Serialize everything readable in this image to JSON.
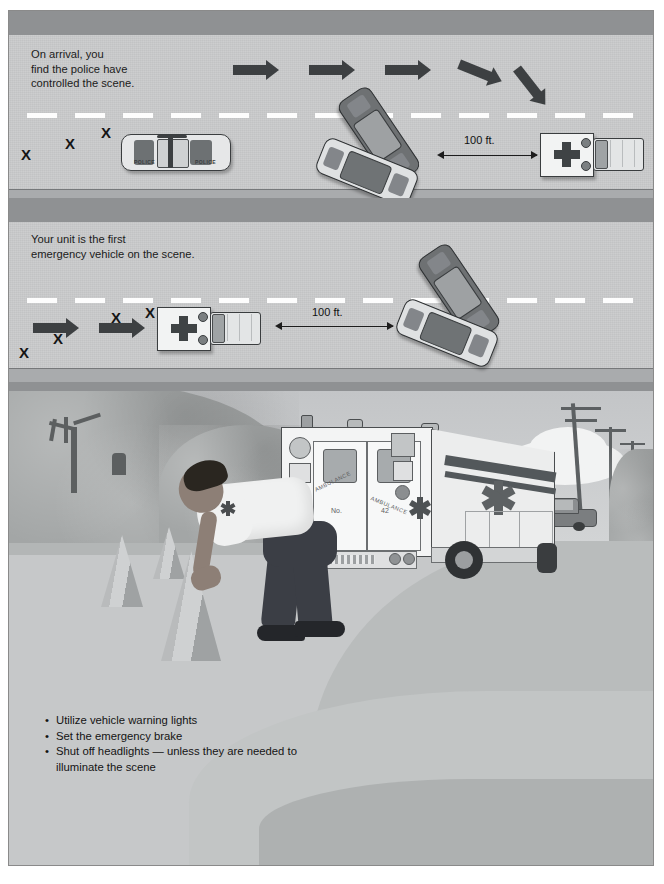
{
  "document": {
    "title": "Emergency Vehicle Scene Positioning",
    "background_color": "#ffffff",
    "frame_border_color": "#8a8a8a"
  },
  "panels": [
    {
      "id": "panel-1",
      "caption": "On arrival, you\nfind the police have\ncontrolled the scene.",
      "dimension_label": "100 ft.",
      "x_marks": [
        "X",
        "X",
        "X"
      ],
      "arrows": 5,
      "vehicles": [
        "police-car",
        "crashed-car-1",
        "crashed-car-2",
        "ambulance"
      ],
      "road_color": "#c9cacb",
      "lane_dash_color": "#fdfdfd"
    },
    {
      "id": "panel-2",
      "caption": "Your unit is the first\nemergency vehicle on the scene.",
      "dimension_label": "100 ft.",
      "x_marks": [
        "X",
        "X",
        "X"
      ],
      "arrows": 2,
      "vehicles": [
        "ambulance",
        "crashed-car-1",
        "crashed-car-2"
      ],
      "road_color": "#c9cacb",
      "lane_dash_color": "#fdfdfd"
    }
  ],
  "scene": {
    "id": "panel-3",
    "ambulance": {
      "unit_label_prefix": "No.",
      "unit_number": "42",
      "door_text_left": "AMBULANCE",
      "door_text_right": "AMBULANCE",
      "body_color": "#f2f3f3",
      "stripe_color": "#53585b"
    },
    "bullets": [
      "Utilize vehicle warning lights",
      "Set the emergency brake",
      "Shut off headlights — unless they are needed to illuminate the scene"
    ],
    "cones": 3,
    "background_objects": [
      "bare-tree",
      "foliage-hillside",
      "utility-pole",
      "utility-pole",
      "utility-pole",
      "parked-car",
      "cloud"
    ]
  },
  "colors": {
    "road": "#c9cacb",
    "separator_band": "#8f9193",
    "shoulder": "#a9abad",
    "ink": "#1b1b1b",
    "arrow": "#3d4042",
    "ground": "#e2e3e4",
    "foliage": "#a3a6a6"
  }
}
